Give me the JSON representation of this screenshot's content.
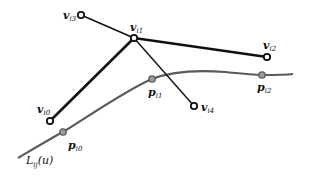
{
  "diagram": {
    "colors": {
      "polygon": "#111111",
      "curve": "#5a5a5a",
      "curve_point_fill": "#9a9a9a",
      "vertex_fill": "#ffffff"
    },
    "vertices": [
      {
        "id": "vi3",
        "base": "v",
        "sub": "i3"
      },
      {
        "id": "vi1",
        "base": "v",
        "sub": "i1"
      },
      {
        "id": "vi2",
        "base": "v",
        "sub": "i2"
      },
      {
        "id": "vi0",
        "base": "v",
        "sub": "i0"
      },
      {
        "id": "vi4",
        "base": "v",
        "sub": "i4"
      }
    ],
    "points": [
      {
        "id": "pi0",
        "base": "p",
        "sub": "i0"
      },
      {
        "id": "pi1",
        "base": "p",
        "sub": "i1"
      },
      {
        "id": "pi2",
        "base": "p",
        "sub": "i2"
      }
    ],
    "edges": [
      {
        "from": "vi3",
        "to": "vi1",
        "weight": "thin"
      },
      {
        "from": "vi1",
        "to": "vi2",
        "weight": "thick"
      },
      {
        "from": "vi1",
        "to": "vi0",
        "weight": "thick"
      },
      {
        "from": "vi1",
        "to": "vi4",
        "weight": "thin"
      }
    ],
    "curve_label": {
      "base": "L",
      "sub": "ij",
      "arg": "(u)"
    }
  }
}
